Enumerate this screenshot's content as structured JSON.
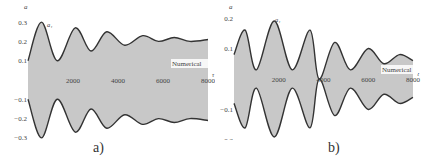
{
  "figure": {
    "panels": [
      {
        "id": "a",
        "label": "a)"
      },
      {
        "id": "b",
        "label": "b)"
      }
    ]
  },
  "chart_data": [
    {
      "type": "area",
      "panel": "a)",
      "title": "",
      "xlabel": "τ",
      "ylabel": "a",
      "curve_label": "a₁",
      "annotation": "Numerical",
      "xlim": [
        0,
        8000
      ],
      "ylim": [
        -0.3,
        0.3
      ],
      "x_ticks": [
        "2000",
        "4000",
        "6000",
        "8000"
      ],
      "y_ticks": [
        "0.3",
        "0.2",
        "0.1",
        "-0.1",
        "-0.2",
        "-0.3"
      ],
      "fill_color": "#c8c8c8",
      "line_color": "#333333",
      "series": [
        {
          "name": "upper envelope",
          "x": [
            0,
            600,
            1300,
            2100,
            2800,
            3500,
            4300,
            5100,
            5800,
            6500,
            7200,
            8000
          ],
          "values": [
            0.1,
            0.3,
            0.1,
            0.27,
            0.15,
            0.25,
            0.18,
            0.23,
            0.2,
            0.22,
            0.2,
            0.21
          ]
        },
        {
          "name": "lower envelope",
          "x": [
            0,
            600,
            1300,
            2100,
            2800,
            3500,
            4300,
            5100,
            5800,
            6500,
            7200,
            8000
          ],
          "values": [
            -0.1,
            -0.3,
            -0.1,
            -0.27,
            -0.15,
            -0.25,
            -0.18,
            -0.23,
            -0.2,
            -0.22,
            -0.2,
            -0.21
          ]
        }
      ]
    },
    {
      "type": "area",
      "panel": "b)",
      "title": "",
      "xlabel": "τ",
      "ylabel": "a",
      "curve_label": "a₁",
      "annotation": "Numerical",
      "xlim": [
        0,
        8000
      ],
      "ylim": [
        -0.2,
        0.2
      ],
      "x_ticks": [
        "2000",
        "4000",
        "6000",
        "8000"
      ],
      "y_ticks": [
        "0.2",
        "0.1",
        "-0.1",
        "-0.2"
      ],
      "fill_color": "#c8c8c8",
      "line_color": "#333333",
      "series": [
        {
          "name": "upper envelope",
          "x": [
            0,
            500,
            1000,
            1800,
            2600,
            3400,
            3800,
            4500,
            5200,
            6000,
            6700,
            7400,
            8000
          ],
          "values": [
            0.08,
            0.16,
            0.03,
            0.19,
            0.03,
            0.16,
            0.0,
            0.12,
            0.03,
            0.1,
            0.05,
            0.08,
            0.06
          ]
        },
        {
          "name": "lower envelope",
          "x": [
            0,
            500,
            1000,
            1800,
            2600,
            3400,
            3800,
            4500,
            5200,
            6000,
            6700,
            7400,
            8000
          ],
          "values": [
            -0.08,
            -0.16,
            -0.03,
            -0.19,
            -0.03,
            -0.16,
            0.0,
            -0.12,
            -0.03,
            -0.1,
            -0.05,
            -0.08,
            -0.06
          ]
        }
      ]
    }
  ]
}
